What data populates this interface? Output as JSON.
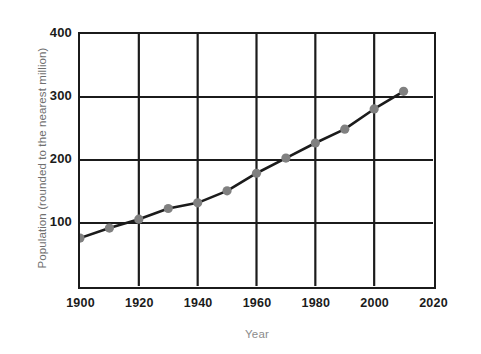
{
  "chart_data": {
    "type": "line",
    "title": "",
    "xlabel": "Year",
    "ylabel": "Population (rounded to the nearest million)",
    "x": [
      1900,
      1910,
      1920,
      1930,
      1940,
      1950,
      1960,
      1970,
      1980,
      1990,
      2000,
      2010
    ],
    "values": [
      76,
      92,
      106,
      123,
      132,
      151,
      179,
      203,
      227,
      249,
      281,
      309
    ],
    "series": [
      {
        "name": "Population",
        "values": [
          76,
          92,
          106,
          123,
          132,
          151,
          179,
          203,
          227,
          249,
          281,
          309
        ]
      }
    ],
    "xlim": [
      1900,
      2020
    ],
    "ylim": [
      0,
      400
    ],
    "xticks": [
      1900,
      1920,
      1940,
      1960,
      1980,
      2000,
      2020
    ],
    "xtick_labels": [
      "1900",
      "1920",
      "1940",
      "1960",
      "1980",
      "2000",
      "2020"
    ],
    "yticks": [
      100,
      200,
      300,
      400
    ],
    "ytick_labels": [
      "100",
      "200",
      "300",
      "400"
    ],
    "grid": true,
    "legend": false,
    "legend_position": "none",
    "marker": "circle",
    "line_color": "#1b1b1b",
    "marker_color": "#808080",
    "grid_color": "#1b1b1b",
    "axis_color": "#1b1b1b",
    "background_color": "#ffffff",
    "xlabel_color": "#8b8b8b",
    "ylabel_color": "#6f6f6f",
    "tick_label_color": "#1b1b1b"
  }
}
